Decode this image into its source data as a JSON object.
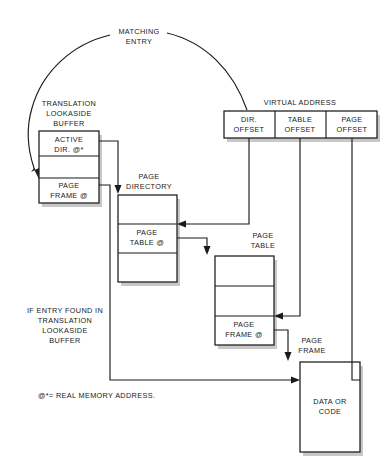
{
  "diagram": {
    "colors": {
      "stroke": "#1a1a1a",
      "fill": "#ffffff",
      "shadow": "#9a9a9a",
      "background": "#ffffff"
    },
    "labels": {
      "matching_entry_line1": "MATCHING",
      "matching_entry_line2": "ENTRY",
      "tlb_caption_line1": "TRANSLATION",
      "tlb_caption_line2": "LOOKASIDE",
      "tlb_caption_line3": "BUFFER",
      "virtual_address": "VIRTUAL ADDRESS",
      "page_directory_line1": "PAGE",
      "page_directory_line2": "DIRECTORY",
      "page_table_caption_line1": "PAGE",
      "page_table_caption_line2": "TABLE",
      "page_frame_caption_line1": "PAGE",
      "page_frame_caption_line2": "FRAME",
      "if_entry_found_line1": "IF ENTRY FOUND IN",
      "if_entry_found_line2": "TRANSLATION",
      "if_entry_found_line3": "LOOKASIDE",
      "if_entry_found_line4": "BUFFER",
      "footnote": "@*= REAL MEMORY ADDRESS."
    },
    "boxes": {
      "tlb": {
        "name": "translation-lookaside-buffer",
        "cells": [
          {
            "line1": "ACTIVE",
            "line2": "DIR. @*"
          },
          {
            "line1": "",
            "line2": ""
          },
          {
            "line1": "PAGE",
            "line2": "FRAME @"
          }
        ]
      },
      "virtual_address": {
        "name": "virtual-address-register",
        "cells": [
          {
            "line1": "DIR.",
            "line2": "OFFSET"
          },
          {
            "line1": "TABLE",
            "line2": "OFFSET"
          },
          {
            "line1": "PAGE",
            "line2": "OFFSET"
          }
        ]
      },
      "page_directory": {
        "name": "page-directory",
        "cells": [
          {
            "line1": "",
            "line2": ""
          },
          {
            "line1": "PAGE",
            "line2": "TABLE @"
          },
          {
            "line1": "",
            "line2": ""
          }
        ]
      },
      "page_table": {
        "name": "page-table",
        "cells": [
          {
            "line1": "",
            "line2": ""
          },
          {
            "line1": "",
            "line2": ""
          },
          {
            "line1": "PAGE",
            "line2": "FRAME @"
          }
        ]
      },
      "data_or_code": {
        "name": "data-or-code",
        "cells": [
          {
            "line1": "DATA OR",
            "line2": "CODE"
          }
        ]
      }
    }
  }
}
